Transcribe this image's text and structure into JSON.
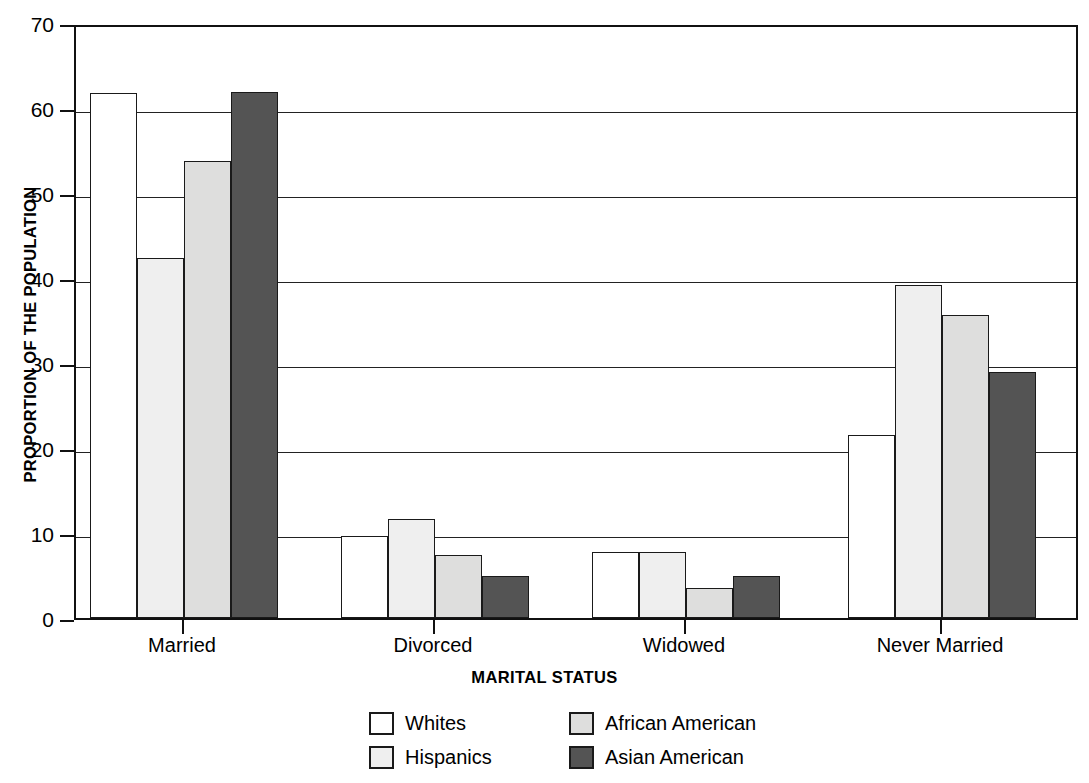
{
  "chart_data": {
    "type": "bar",
    "title": "",
    "xlabel": "MARITAL STATUS",
    "ylabel": "PROPORTION OF THE POPULATION",
    "categories": [
      "Married",
      "Divorced",
      "Widowed",
      "Never Married"
    ],
    "ylim": [
      0,
      70
    ],
    "yticks": [
      0,
      10,
      20,
      30,
      40,
      50,
      60,
      70
    ],
    "ytick_labels": [
      "0",
      "10",
      "20",
      "30",
      "40",
      "50",
      "60",
      "70"
    ],
    "grid": "horizontal",
    "legend_position": "below-axis",
    "series": [
      {
        "name": "Whites",
        "color": "#ffffff",
        "values": [
          61.8,
          9.7,
          7.8,
          21.5
        ]
      },
      {
        "name": "Hispanics",
        "color": "#efefef",
        "values": [
          42.4,
          11.6,
          7.8,
          39.2
        ]
      },
      {
        "name": "African American",
        "color": "#dededd",
        "values": [
          53.8,
          7.4,
          3.5,
          35.7
        ]
      },
      {
        "name": "Asian American",
        "color": "#545454",
        "values": [
          61.9,
          4.9,
          4.9,
          28.9
        ]
      }
    ],
    "bar_edge_color": "#1a1a1a",
    "axis_color": "#111111",
    "background_color": "#ffffff"
  }
}
